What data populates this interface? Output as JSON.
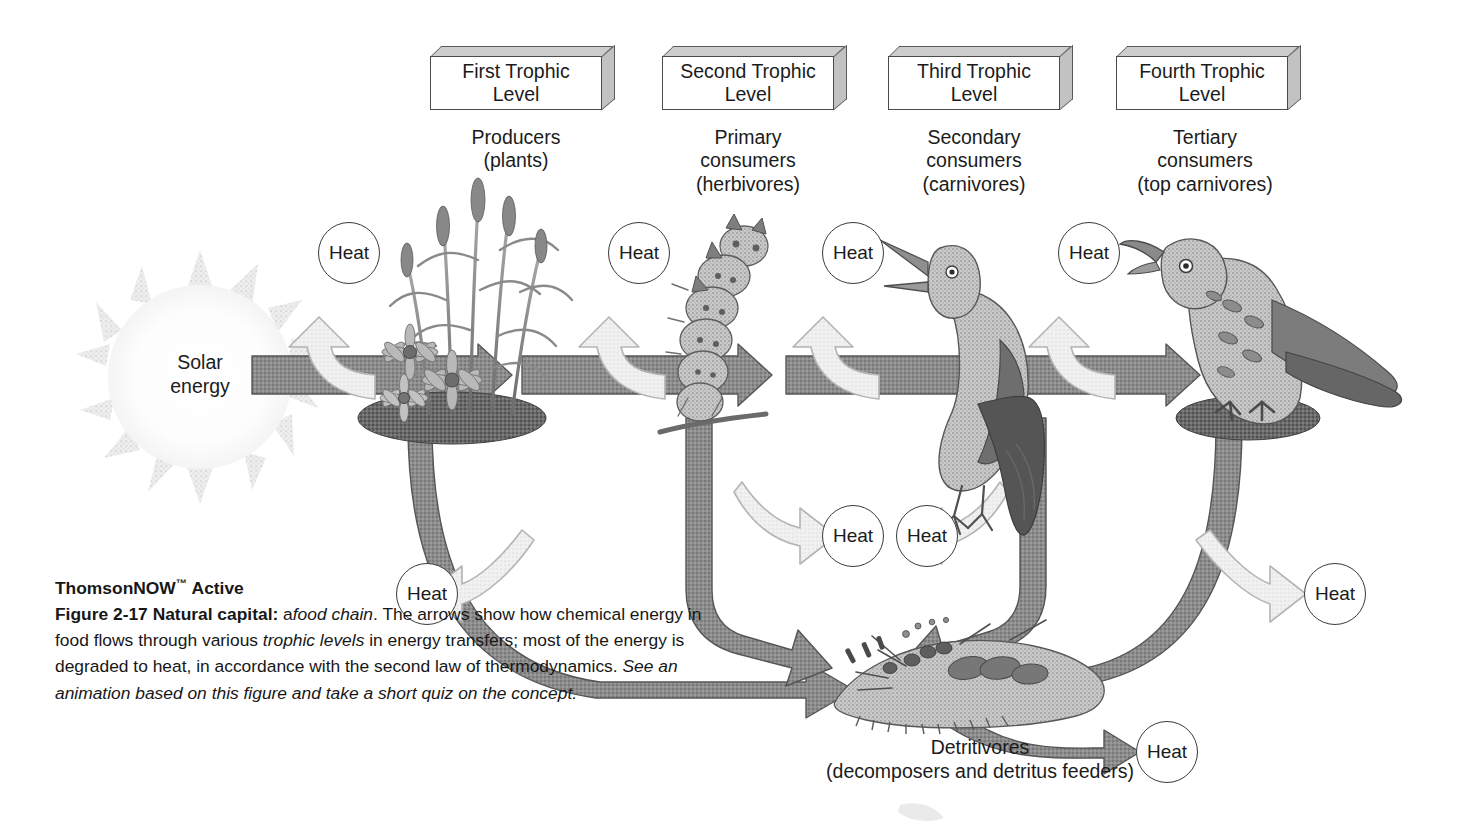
{
  "figure": {
    "solar": {
      "line1": "Solar",
      "line2": "energy"
    },
    "heat_label": "Heat",
    "trophic_levels": [
      {
        "box_line1": "First Trophic",
        "box_line2": "Level",
        "caption_line1": "Producers",
        "caption_line2": "(plants)",
        "caption_line3": "",
        "organism": "grass-and-flowers-illustration"
      },
      {
        "box_line1": "Second Trophic",
        "box_line2": "Level",
        "caption_line1": "Primary",
        "caption_line2": "consumers",
        "caption_line3": "(herbivores)",
        "organism": "caterpillar-illustration"
      },
      {
        "box_line1": "Third Trophic",
        "box_line2": "Level",
        "caption_line1": "Secondary",
        "caption_line2": "consumers",
        "caption_line3": "(carnivores)",
        "organism": "songbird-illustration"
      },
      {
        "box_line1": "Fourth Trophic",
        "box_line2": "Level",
        "caption_line1": "Tertiary",
        "caption_line2": "consumers",
        "caption_line3": "(top carnivores)",
        "organism": "hawk-illustration"
      }
    ],
    "detritivores": {
      "line1": "Detritivores",
      "line2": "(decomposers and detritus feeders)"
    },
    "heat_bubbles": [
      {
        "id": "heat-producers",
        "label": "Heat"
      },
      {
        "id": "heat-primary",
        "label": "Heat"
      },
      {
        "id": "heat-secondary",
        "label": "Heat"
      },
      {
        "id": "heat-tertiary",
        "label": "Heat"
      },
      {
        "id": "heat-detritus-left",
        "label": "Heat"
      },
      {
        "id": "heat-detritus-right",
        "label": "Heat"
      },
      {
        "id": "heat-lower-left",
        "label": "Heat"
      },
      {
        "id": "heat-lower-right",
        "label": "Heat"
      },
      {
        "id": "heat-detritivores",
        "label": "Heat"
      }
    ],
    "colors": {
      "flow_arrow": "#8d8d8d",
      "flow_arrow_outline": "#555555",
      "heat_arrow": "#ededed",
      "heat_arrow_outline": "#b4b4b4",
      "box_top": "#cdcdcd",
      "box_side": "#c2c2c2",
      "text": "#1b1b1b"
    }
  },
  "caption": {
    "brand": "ThomsonNOW",
    "brand_tm": "™",
    "brand_suffix": "Active",
    "figure_number": "Figure 2-17",
    "figure_title": "Natural capital:",
    "body_a": " a",
    "italic_1": "food chain",
    "body_1": ". The arrows show how chemical energy in food flows through various ",
    "italic_2": "trophic levels",
    "body_2": " in energy transfers; most of the energy is degraded to heat, in accordance with the second law of thermodynamics. ",
    "italic_3": "See an animation based on this figure and take a short quiz on the concept."
  }
}
